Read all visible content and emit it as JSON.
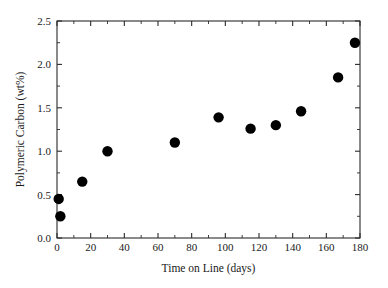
{
  "chart_data": {
    "type": "scatter",
    "title": "",
    "xlabel": "Time on Line (days)",
    "ylabel": "Polymeric Carbon (wt%)",
    "xlim": [
      0,
      180
    ],
    "ylim": [
      0.0,
      2.5
    ],
    "grid": false,
    "legend": null,
    "marker": {
      "shape": "circle",
      "color": "#000000",
      "size_px": 5.2
    },
    "x_ticks": [
      0,
      20,
      40,
      60,
      80,
      100,
      120,
      140,
      160,
      180
    ],
    "x_tick_labels": [
      "0",
      "20",
      "40",
      "60",
      "80",
      "100",
      "120",
      "140",
      "160",
      "180"
    ],
    "x_minor_step": 10,
    "y_ticks": [
      0.0,
      0.5,
      1.0,
      1.5,
      2.0,
      2.5
    ],
    "y_tick_labels": [
      "0.0",
      "0.5",
      "1.0",
      "1.5",
      "2.0",
      "2.5"
    ],
    "y_minor_step": 0.25,
    "series": [
      {
        "name": "Polymeric Carbon",
        "points": [
          {
            "x": 1,
            "y": 0.45
          },
          {
            "x": 2,
            "y": 0.25
          },
          {
            "x": 15,
            "y": 0.65
          },
          {
            "x": 30,
            "y": 1.0
          },
          {
            "x": 70,
            "y": 1.1
          },
          {
            "x": 96,
            "y": 1.39
          },
          {
            "x": 115,
            "y": 1.26
          },
          {
            "x": 130,
            "y": 1.3
          },
          {
            "x": 145,
            "y": 1.46
          },
          {
            "x": 167,
            "y": 1.85
          },
          {
            "x": 177,
            "y": 2.25
          }
        ]
      }
    ]
  },
  "figure": {
    "background_color": "#ffffff",
    "axis_color": "#2b2b2b"
  }
}
